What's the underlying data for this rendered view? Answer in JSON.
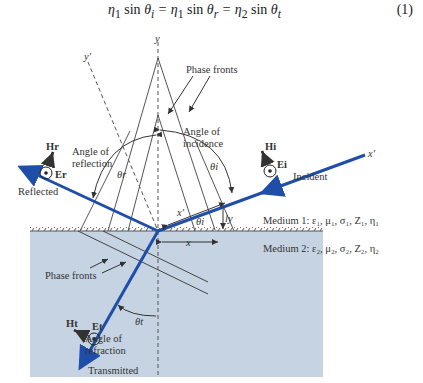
{
  "equation": {
    "text": "η₁ sin θᵢ = η₁ sin θᵣ = η₂ sin θₜ",
    "number": "(1)"
  },
  "diagram": {
    "axes": {
      "y": "y",
      "y_prime": "y'",
      "x_prime": "x'",
      "x": "x"
    },
    "labels": {
      "phase_fronts_top": "Phase fronts",
      "phase_fronts_bottom": "Phase fronts",
      "angle_of_incidence_1": "Angle of",
      "angle_of_incidence_2": "incidence",
      "angle_of_reflection_1": "Angle of",
      "angle_of_reflection_2": "reflection",
      "angle_of_refraction_1": "Angle of",
      "angle_of_refraction_2": "refraction",
      "reflected": "Reflected",
      "incident": "Incident",
      "transmitted": "Transmitted",
      "medium1": "Medium 1: ε₁, μ₁, σ₁, Z₁, η₁",
      "medium2": "Medium 2: ε₂, μ₂, σ₂, Z₂, η₂"
    },
    "symbols": {
      "theta_i": "θi",
      "theta_r": "θr",
      "theta_t": "θt",
      "H_r": "Hr",
      "E_r": "Er",
      "H_i": "Hi",
      "E_i": "Ei",
      "H_t": "Ht",
      "E_t": "Et",
      "ly": "ly",
      "lx": "x'"
    },
    "colors": {
      "ray": "#1f4ea8",
      "medium2_fill": "#c5d3e3",
      "line": "#444444"
    }
  }
}
